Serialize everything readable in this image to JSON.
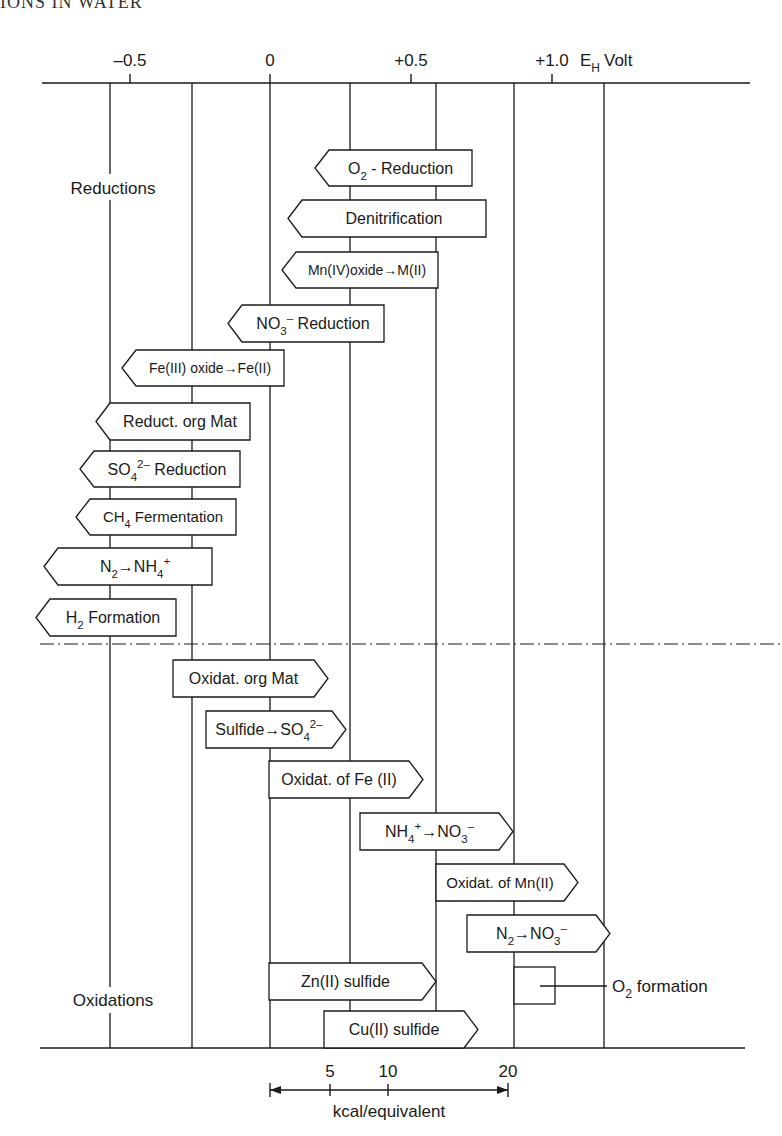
{
  "page": {
    "header_fragment": "IONS IN WATER"
  },
  "axis": {
    "title_main": "E",
    "title_sub": "H",
    "title_unit": "Volt",
    "ticks": [
      {
        "label": "–0.5",
        "value": -0.5
      },
      {
        "label": "0",
        "value": 0
      },
      {
        "label": "+0.5",
        "value": 0.5
      },
      {
        "label": "+1.0",
        "value": 1.0
      }
    ]
  },
  "sections": {
    "reductions": "Reductions",
    "oxidations": "Oxidations"
  },
  "reductions": [
    {
      "id": "o2-reduction",
      "parts": [
        [
          "O",
          ""
        ],
        [
          "2",
          "sub"
        ],
        [
          " - Reduction",
          ""
        ]
      ]
    },
    {
      "id": "denitrification",
      "parts": [
        [
          "Denitrification",
          ""
        ]
      ]
    },
    {
      "id": "mn-reduction",
      "parts": [
        [
          "Mn(IV)oxide→M(II)",
          ""
        ]
      ]
    },
    {
      "id": "no3-reduction",
      "parts": [
        [
          "NO",
          ""
        ],
        [
          "3",
          "sub"
        ],
        [
          "–",
          "sup"
        ],
        [
          " Reduction",
          ""
        ]
      ]
    },
    {
      "id": "fe-reduction",
      "parts": [
        [
          "Fe(III) oxide→Fe(II)",
          ""
        ]
      ]
    },
    {
      "id": "org-reduction",
      "parts": [
        [
          "Reduct. org Mat",
          ""
        ]
      ]
    },
    {
      "id": "so4-reduction",
      "parts": [
        [
          "SO",
          ""
        ],
        [
          "4",
          "sub"
        ],
        [
          "2–",
          "sup"
        ],
        [
          " Reduction",
          ""
        ]
      ]
    },
    {
      "id": "ch4-fermentation",
      "parts": [
        [
          "CH",
          ""
        ],
        [
          "4",
          "sub"
        ],
        [
          " Fermentation",
          ""
        ]
      ]
    },
    {
      "id": "n2-nh4",
      "parts": [
        [
          "N",
          ""
        ],
        [
          "2",
          "sub"
        ],
        [
          "→NH",
          ""
        ],
        [
          "4",
          "sub"
        ],
        [
          "+",
          "sup"
        ]
      ]
    },
    {
      "id": "h2-formation",
      "parts": [
        [
          "H",
          ""
        ],
        [
          "2",
          "sub"
        ],
        [
          " Formation",
          ""
        ]
      ]
    }
  ],
  "oxidations": [
    {
      "id": "org-oxidation",
      "parts": [
        [
          "Oxidat. org Mat",
          ""
        ]
      ]
    },
    {
      "id": "sulfide-oxidation",
      "parts": [
        [
          "Sulfide→SO",
          ""
        ],
        [
          "4",
          "sub"
        ],
        [
          "2–",
          "sup"
        ]
      ]
    },
    {
      "id": "fe-oxidation",
      "parts": [
        [
          "Oxidat. of Fe (II)",
          ""
        ]
      ]
    },
    {
      "id": "nitrification",
      "parts": [
        [
          "NH",
          ""
        ],
        [
          "4",
          "sub"
        ],
        [
          "+",
          "sup"
        ],
        [
          "→NO",
          ""
        ],
        [
          "3",
          "sub"
        ],
        [
          "–",
          "sup"
        ]
      ]
    },
    {
      "id": "mn-oxidation",
      "parts": [
        [
          "Oxidat. of Mn(II)",
          ""
        ]
      ]
    },
    {
      "id": "n2-no3",
      "parts": [
        [
          "N",
          ""
        ],
        [
          "2",
          "sub"
        ],
        [
          "→NO",
          ""
        ],
        [
          "3",
          "sub"
        ],
        [
          "–",
          "sup"
        ]
      ]
    },
    {
      "id": "zn-sulfide",
      "parts": [
        [
          "Zn(II) sulfide",
          ""
        ]
      ]
    },
    {
      "id": "cu-sulfide",
      "parts": [
        [
          "Cu(II) sulfide",
          ""
        ]
      ]
    }
  ],
  "o2_formation": {
    "parts": [
      [
        "O",
        ""
      ],
      [
        "2",
        "sub"
      ],
      [
        " formation",
        ""
      ]
    ]
  },
  "scale": {
    "label": "kcal/equivalent",
    "ticks": [
      "5",
      "10",
      "20"
    ]
  }
}
